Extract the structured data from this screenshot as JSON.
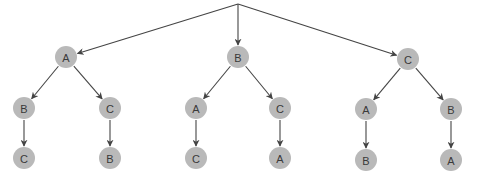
{
  "diagram": {
    "type": "permutation-tree",
    "root": {
      "x": 238,
      "y": 4
    },
    "node_radius": 11,
    "colors": {
      "node_fill": "#b9b9b9",
      "label": "#3a3a3a",
      "edge": "#444444"
    },
    "nodes": [
      {
        "id": "n1",
        "label": "A",
        "x": 66,
        "y": 57
      },
      {
        "id": "n2",
        "label": "B",
        "x": 238,
        "y": 57
      },
      {
        "id": "n3",
        "label": "C",
        "x": 408,
        "y": 59
      },
      {
        "id": "n11",
        "label": "B",
        "x": 24,
        "y": 108
      },
      {
        "id": "n12",
        "label": "C",
        "x": 110,
        "y": 108
      },
      {
        "id": "n21",
        "label": "A",
        "x": 196,
        "y": 108
      },
      {
        "id": "n22",
        "label": "C",
        "x": 280,
        "y": 108
      },
      {
        "id": "n31",
        "label": "A",
        "x": 366,
        "y": 109
      },
      {
        "id": "n32",
        "label": "B",
        "x": 451,
        "y": 109
      },
      {
        "id": "n111",
        "label": "C",
        "x": 24,
        "y": 158
      },
      {
        "id": "n121",
        "label": "B",
        "x": 110,
        "y": 158
      },
      {
        "id": "n211",
        "label": "C",
        "x": 196,
        "y": 158
      },
      {
        "id": "n221",
        "label": "A",
        "x": 280,
        "y": 158
      },
      {
        "id": "n311",
        "label": "B",
        "x": 366,
        "y": 160
      },
      {
        "id": "n321",
        "label": "A",
        "x": 451,
        "y": 160
      }
    ],
    "edges": [
      [
        "root",
        "n1"
      ],
      [
        "root",
        "n2"
      ],
      [
        "root",
        "n3"
      ],
      [
        "n1",
        "n11"
      ],
      [
        "n1",
        "n12"
      ],
      [
        "n2",
        "n21"
      ],
      [
        "n2",
        "n22"
      ],
      [
        "n3",
        "n31"
      ],
      [
        "n3",
        "n32"
      ],
      [
        "n11",
        "n111"
      ],
      [
        "n12",
        "n121"
      ],
      [
        "n21",
        "n211"
      ],
      [
        "n22",
        "n221"
      ],
      [
        "n31",
        "n311"
      ],
      [
        "n32",
        "n321"
      ]
    ]
  }
}
